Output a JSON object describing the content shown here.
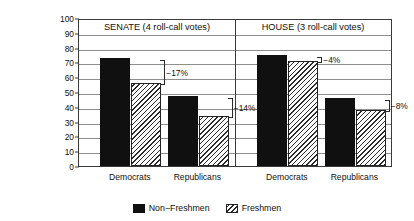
{
  "chart_data": {
    "type": "bar",
    "title": "",
    "xlabel": "",
    "ylabel_line1": "% of Votes in Support of",
    "ylabel_line2": "Administration Position",
    "ylim": [
      0,
      100
    ],
    "ytick_labels": [
      "0",
      "10",
      "20",
      "30",
      "40",
      "50",
      "60",
      "70",
      "80",
      "90",
      "100"
    ],
    "ytick_values": [
      0,
      10,
      20,
      30,
      40,
      50,
      60,
      70,
      80,
      90,
      100
    ],
    "grid": true,
    "legend_position": "bottom-center",
    "legend": [
      "Non−Freshmen",
      "Freshmen"
    ],
    "categories": [
      "Democrats",
      "Republicans",
      "Democrats",
      "Republicans"
    ],
    "panels": [
      {
        "name": "senate",
        "title": "SENATE (4 roll-call votes)",
        "groups": [
          {
            "category": "Democrats",
            "non_freshmen": 73,
            "freshmen": 56,
            "annotation": "−17%"
          },
          {
            "category": "Republicans",
            "non_freshmen": 47.5,
            "freshmen": 33.5,
            "annotation": "−14%"
          }
        ]
      },
      {
        "name": "house",
        "title": "HOUSE (3 roll-call votes)",
        "groups": [
          {
            "category": "Democrats",
            "non_freshmen": 75,
            "freshmen": 71,
            "annotation": "−4%"
          },
          {
            "category": "Republicans",
            "non_freshmen": 46,
            "freshmen": 38,
            "annotation": "−8%"
          }
        ]
      }
    ],
    "series": [
      {
        "name": "Non−Freshmen",
        "values": [
          73,
          47.5,
          75,
          46
        ]
      },
      {
        "name": "Freshmen",
        "values": [
          56,
          33.5,
          71,
          38
        ]
      }
    ],
    "annotations": [
      "−17%",
      "−14%",
      "−4%",
      "−8%"
    ]
  },
  "colors": {
    "non_freshmen": "#101010",
    "freshmen_fill": "#ffffff",
    "freshmen_hatch": "#2b2b2b",
    "axis": "#3a3a3a",
    "grid": "#8e8e8e",
    "background": "#ffffff"
  }
}
